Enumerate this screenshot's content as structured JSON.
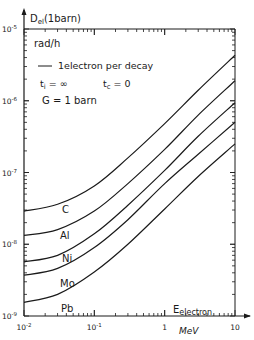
{
  "chart_data": {
    "type": "line",
    "title": "",
    "ylabel": "D_el(1barn)",
    "yunit": "rad/h",
    "xlabel": "E_electron",
    "xunit": "MeV",
    "xscale": "log",
    "yscale": "log",
    "xlim": [
      0.01,
      10
    ],
    "ylim": [
      1e-09,
      1e-05
    ],
    "grid": false,
    "x_ticks": [
      "10^-2",
      "10^-1",
      "1",
      "10"
    ],
    "y_ticks": [
      "10^-5",
      "10^-6",
      "10^-7",
      "10^-8",
      "10^-9"
    ],
    "annotations": [
      "— 1electron per decay",
      "t_i = ∞",
      "t_c = 0",
      "σ = 1 barn"
    ],
    "x": [
      0.01,
      0.03,
      0.1,
      0.3,
      1,
      3,
      10
    ],
    "series": [
      {
        "name": "C",
        "values": [
          2.9e-08,
          3.6e-08,
          6.5e-08,
          1.6e-07,
          4.8e-07,
          1.4e-06,
          4.3e-06
        ]
      },
      {
        "name": "Al",
        "values": [
          1.33e-08,
          1.6e-08,
          2.9e-08,
          7e-08,
          2.1e-07,
          6.3e-07,
          1.9e-06
        ]
      },
      {
        "name": "Ni",
        "values": [
          5.7e-09,
          7e-09,
          1.4e-08,
          3.5e-08,
          1.07e-07,
          3.2e-07,
          9.4e-07
        ]
      },
      {
        "name": "Mo",
        "values": [
          3.7e-09,
          4.6e-09,
          9e-09,
          2.2e-08,
          7e-08,
          1.8e-07,
          5e-07
        ]
      },
      {
        "name": "Pb",
        "values": [
          1.55e-09,
          2e-09,
          4.1e-09,
          1e-08,
          3.1e-08,
          8.8e-08,
          2.5e-07
        ]
      }
    ]
  },
  "labels": {
    "y_title_main": "D",
    "y_title_sub": "el",
    "y_title_rest": "(1barn)",
    "y_unit": "rad/h",
    "legend_line": "1electron per decay",
    "ti_main": "t",
    "ti_sub": "i",
    "ti_rest": " = ∞",
    "tc_main": "t",
    "tc_sub": "c",
    "tc_rest": " = 0",
    "sigma": "G = 1 barn",
    "x_title_main": "E",
    "x_title_sub": "electron",
    "x_unit": "MeV"
  }
}
